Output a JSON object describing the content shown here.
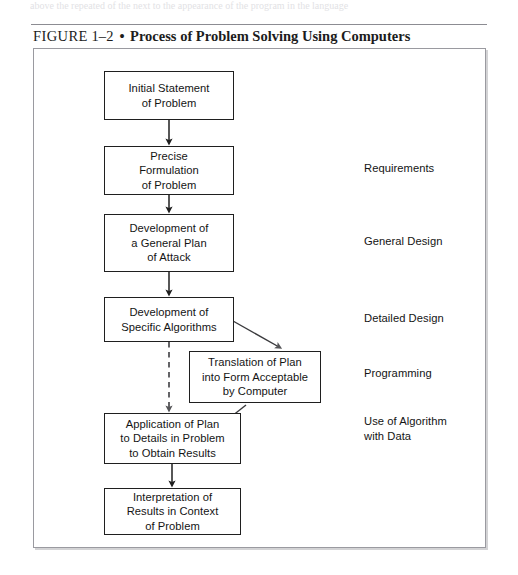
{
  "page": {
    "bleed_text": "above the repeated of the next to the appearance of the program in the language"
  },
  "caption": {
    "figure_word": "FIGURE",
    "number": "1–2",
    "separator": "•",
    "title": "Process of Problem Solving Using Computers"
  },
  "diagram": {
    "type": "flowchart",
    "nodes": [
      {
        "id": "initial-statement",
        "text": "Initial Statement\nof Problem"
      },
      {
        "id": "precise-formulation",
        "text": "Precise\nFormulation\nof Problem"
      },
      {
        "id": "general-plan",
        "text": "Development of\na General Plan\nof Attack"
      },
      {
        "id": "specific-algorithms",
        "text": "Development of\nSpecific Algorithms"
      },
      {
        "id": "translation",
        "text": "Translation of Plan\ninto Form Acceptable\nby Computer"
      },
      {
        "id": "application",
        "text": "Application of Plan\nto Details in Problem\nto Obtain Results"
      },
      {
        "id": "interpretation",
        "text": "Interpretation of\nResults in Context\nof Problem"
      }
    ],
    "stage_labels": [
      {
        "id": "requirements",
        "text": "Requirements"
      },
      {
        "id": "general-design",
        "text": "General Design"
      },
      {
        "id": "detailed-design",
        "text": "Detailed Design"
      },
      {
        "id": "programming",
        "text": "Programming"
      },
      {
        "id": "use-of-algorithm",
        "text": "Use of Algorithm\nwith Data"
      }
    ],
    "connectors": [
      {
        "from": "initial-statement",
        "to": "precise-formulation",
        "style": "solid",
        "direction": "down"
      },
      {
        "from": "precise-formulation",
        "to": "general-plan",
        "style": "solid",
        "direction": "down"
      },
      {
        "from": "general-plan",
        "to": "specific-algorithms",
        "style": "solid",
        "direction": "down"
      },
      {
        "from": "specific-algorithms",
        "to": "translation",
        "style": "solid",
        "direction": "diagonal-down-right"
      },
      {
        "from": "specific-algorithms",
        "to": "application",
        "style": "dashed",
        "direction": "down"
      },
      {
        "from": "translation",
        "to": "application",
        "style": "solid",
        "direction": "diagonal-down-left"
      },
      {
        "from": "application",
        "to": "interpretation",
        "style": "solid",
        "direction": "down"
      }
    ],
    "colors": {
      "line": "#1f1f1f",
      "frame": "#9a9aa0",
      "text": "#141414",
      "background": "#ffffff"
    }
  }
}
